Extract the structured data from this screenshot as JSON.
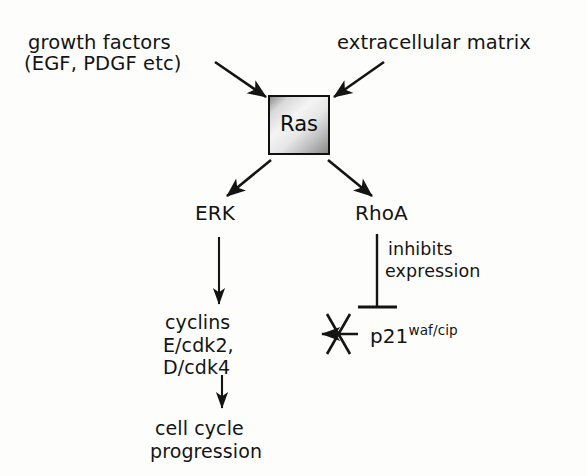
{
  "diagram": {
    "background_color": "#fdfdfb",
    "ink_color": "#141414",
    "inputs": [
      {
        "name": "growth-factors",
        "line1": "growth factors",
        "line2": "(EGF, PDGF etc)"
      },
      {
        "name": "extracellular-matrix",
        "line1": "extracellular matrix"
      }
    ],
    "hub": {
      "name": "Ras",
      "label": "Ras",
      "shape": "rectangle",
      "border_color": "#101010",
      "fill_light": "#f4f4f4",
      "fill_dark": "#8a8a8a"
    },
    "effectors": [
      {
        "name": "ERK",
        "label": "ERK"
      },
      {
        "name": "RhoA",
        "label": "RhoA"
      }
    ],
    "annotations": [
      {
        "name": "inhibits-expression",
        "line1": "inhibits",
        "line2": "expression"
      }
    ],
    "targets": [
      {
        "name": "cyclins",
        "line1": "cyclins",
        "line2": "E/cdk2,",
        "line3": "D/cdk4"
      },
      {
        "name": "cell-cycle-progression",
        "line1": "cell cycle",
        "line2": "progression"
      },
      {
        "name": "p21",
        "base": "p21",
        "superscript": "waf/cip"
      }
    ],
    "edges": [
      {
        "from": "growth factors (EGF, PDGF etc)",
        "to": "Ras",
        "type": "activating-arrow"
      },
      {
        "from": "extracellular matrix",
        "to": "Ras",
        "type": "activating-arrow"
      },
      {
        "from": "Ras",
        "to": "ERK",
        "type": "activating-arrow"
      },
      {
        "from": "Ras",
        "to": "RhoA",
        "type": "activating-arrow"
      },
      {
        "from": "ERK",
        "to": "cyclins E/cdk2, D/cdk4",
        "type": "activating-arrow"
      },
      {
        "from": "cyclins E/cdk2, D/cdk4",
        "to": "cell cycle progression",
        "type": "activating-arrow"
      },
      {
        "from": "RhoA",
        "to": "p21waf/cip",
        "type": "inhibition-bar",
        "label": "inhibits expression"
      },
      {
        "from": "p21waf/cip",
        "to": "cyclins E/cdk2, D/cdk4",
        "type": "blocked-arrow"
      }
    ]
  }
}
